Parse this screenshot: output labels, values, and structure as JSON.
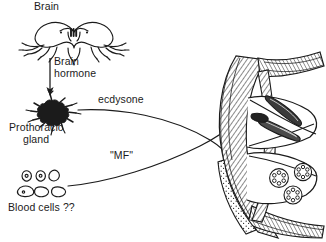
{
  "figure": {
    "kind": "biological-diagram",
    "background_color": "#ffffff",
    "ink_color": "#1b1b1b",
    "width": 326,
    "height": 242
  },
  "labels": {
    "brain": "Brain",
    "brain_hormone_line1": "Brain",
    "brain_hormone_line2": "hormone",
    "ecdysone": "ecdysone",
    "prothoracic_line1": "Prothoracic",
    "prothoracic_line2": "gland",
    "mf": "\"MF\"",
    "blood_cells": "Blood cells ??"
  },
  "structures": {
    "brain": "bilobed-insect-brain-with-nerve-branches",
    "prothoracic_gland": "dark-branching-stellate-gland",
    "blood_cells": "six-small-hemocyte-outlines-two-rows",
    "cross_section": "hatched-tissue-cross-section-with-elongated-bodies-and-round-radial-cells"
  },
  "connectors": {
    "brain_to_gland": "downward-arrow",
    "ecdysone_path": "curved-line-gland-to-cross-section",
    "mf_path": "curved-line-blood-cells-to-cross-section",
    "crossing": "ecdysone-and-mf-lines-cross-in-x-pattern"
  }
}
